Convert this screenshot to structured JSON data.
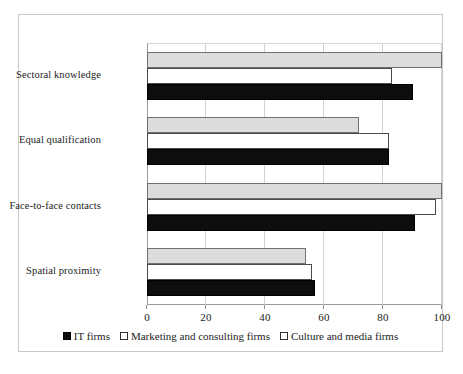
{
  "chart_data": {
    "type": "bar",
    "orientation": "horizontal",
    "title": "",
    "subtitle": "",
    "xlabel": "",
    "ylabel": "",
    "xlim": [
      0,
      100
    ],
    "xticks": [
      0,
      20,
      40,
      60,
      80,
      100
    ],
    "xtick_labels": [
      "0",
      "20",
      "40",
      "60",
      "80",
      "100"
    ],
    "grid": true,
    "grid_axis": "x",
    "legend_position": "bottom",
    "categories": [
      "Sectoral knowledge",
      "Equal qualification",
      "Face-to-face contacts",
      "Spatial proximity"
    ],
    "series": [
      {
        "name": "IT firms",
        "marker": "filled-black-square",
        "color": "#0d0d0d",
        "values": [
          90,
          82,
          91,
          57
        ]
      },
      {
        "name": "Marketing and consulting firms",
        "marker": "open-square",
        "color": "#ffffff",
        "values": [
          83,
          82,
          98,
          56
        ]
      },
      {
        "name": "Culture and media firms",
        "marker": "open-square",
        "color": "#dcdcdc",
        "values": [
          100,
          72,
          100,
          54
        ]
      }
    ]
  },
  "legend": {
    "items": [
      {
        "label": "IT firms",
        "swatch": "filled-square-icon"
      },
      {
        "label": "Marketing and consulting firms",
        "swatch": "open-square-icon"
      },
      {
        "label": "Culture and media firms",
        "swatch": "open-square-icon"
      }
    ]
  }
}
